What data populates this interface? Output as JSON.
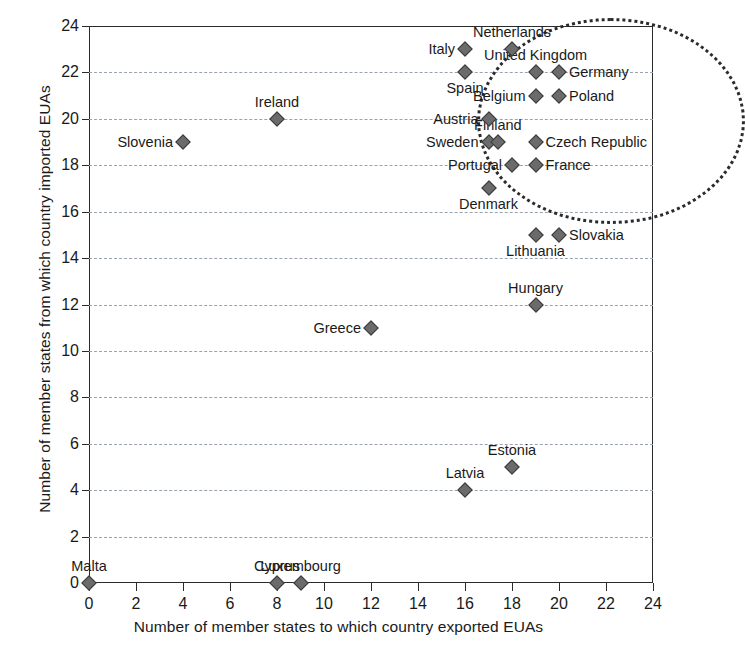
{
  "chart_data": {
    "type": "scatter",
    "title": "",
    "xlabel": "Number of member states to which country exported EUAs",
    "ylabel": "Number of member states from which country imported EUAs",
    "xlim": [
      0,
      24
    ],
    "ylim": [
      0,
      24
    ],
    "xticks": [
      0,
      2,
      4,
      6,
      8,
      10,
      12,
      14,
      16,
      18,
      20,
      22,
      24
    ],
    "yticks": [
      0,
      2,
      4,
      6,
      8,
      10,
      12,
      14,
      16,
      18,
      20,
      22,
      24
    ],
    "grid": "horizontal-dashed",
    "legend": "none",
    "marker_shape": "diamond",
    "marker_color": "#6b6b6b",
    "points": [
      {
        "label": "Malta",
        "x": 0,
        "y": 0,
        "label_pos": "above"
      },
      {
        "label": "Cyprus",
        "x": 8,
        "y": 0,
        "label_pos": "above"
      },
      {
        "label": "Luxembourg",
        "x": 9,
        "y": 0,
        "label_pos": "above"
      },
      {
        "label": "Latvia",
        "x": 16,
        "y": 4,
        "label_pos": "above"
      },
      {
        "label": "Estonia",
        "x": 18,
        "y": 5,
        "label_pos": "above"
      },
      {
        "label": "Greece",
        "x": 12,
        "y": 11,
        "label_pos": "left"
      },
      {
        "label": "Hungary",
        "x": 19,
        "y": 12,
        "label_pos": "above"
      },
      {
        "label": "Lithuania",
        "x": 19,
        "y": 15,
        "label_pos": "below"
      },
      {
        "label": "Slovakia",
        "x": 20,
        "y": 15,
        "label_pos": "right"
      },
      {
        "label": "Denmark",
        "x": 17,
        "y": 17,
        "label_pos": "below"
      },
      {
        "label": "Portugal",
        "x": 18,
        "y": 18,
        "label_pos": "left"
      },
      {
        "label": "France",
        "x": 19,
        "y": 18,
        "label_pos": "right"
      },
      {
        "label": "Slovenia",
        "x": 4,
        "y": 19,
        "label_pos": "left"
      },
      {
        "label": "Sweden",
        "x": 17,
        "y": 19,
        "label_pos": "left"
      },
      {
        "label": "Finland",
        "x": 17.4,
        "y": 19,
        "label_pos": "above"
      },
      {
        "label": "Czech Republic",
        "x": 19,
        "y": 19,
        "label_pos": "right"
      },
      {
        "label": "Ireland",
        "x": 8,
        "y": 20,
        "label_pos": "above"
      },
      {
        "label": "Austria",
        "x": 17,
        "y": 20,
        "label_pos": "left"
      },
      {
        "label": "Belgium",
        "x": 19,
        "y": 21,
        "label_pos": "left"
      },
      {
        "label": "Poland",
        "x": 20,
        "y": 21,
        "label_pos": "right"
      },
      {
        "label": "Spain",
        "x": 16,
        "y": 22,
        "label_pos": "below"
      },
      {
        "label": "United Kingdom",
        "x": 19,
        "y": 22,
        "label_pos": "above"
      },
      {
        "label": "Germany",
        "x": 20,
        "y": 22,
        "label_pos": "right"
      },
      {
        "label": "Italy",
        "x": 16,
        "y": 23,
        "label_pos": "left"
      },
      {
        "label": "Netherlands",
        "x": 18,
        "y": 23,
        "label_pos": "above"
      }
    ],
    "annotations": [
      {
        "type": "ellipse",
        "name": "high-trade-cluster",
        "center_x": 22.2,
        "center_y": 19.9,
        "radius_x": 5.7,
        "radius_y": 4.45,
        "style": "dotted"
      }
    ]
  }
}
